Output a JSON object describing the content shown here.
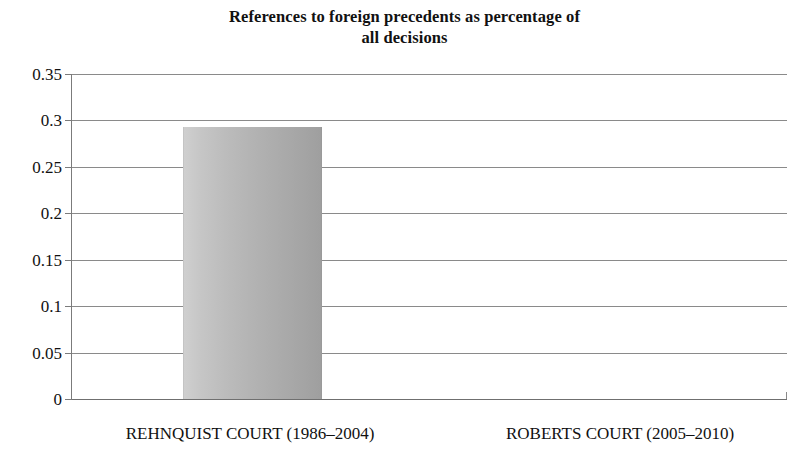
{
  "chart_data": {
    "type": "bar",
    "title": "References to foreign precedents as percentage of all decisions",
    "title_lines": [
      "References to foreign precedents as percentage of",
      "all decisions"
    ],
    "categories": [
      "REHNQUIST COURT (1986–2004)",
      "ROBERTS COURT (2005–2010)"
    ],
    "values": [
      0.293,
      0
    ],
    "xlabel": "",
    "ylabel": "",
    "ylim": [
      0,
      0.35
    ],
    "ytick_values": [
      0,
      0.05,
      0.1,
      0.15,
      0.2,
      0.25,
      0.3,
      0.35
    ],
    "ytick_labels": [
      "0",
      "0.05",
      "0.1",
      "0.15",
      "0.2",
      "0.25",
      "0.3",
      "0.35"
    ],
    "grid": true,
    "legend": null,
    "legend_position": "none",
    "colors": {
      "bar_fill_left": "#cfcfcf",
      "bar_fill_right": "#9f9f9f",
      "gridline": "#8a8a8a",
      "axis": "#7b7b7b",
      "text": "#111111",
      "background": "#ffffff"
    }
  }
}
